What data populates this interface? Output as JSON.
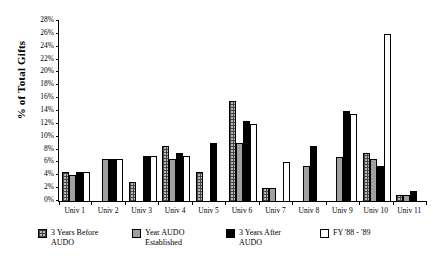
{
  "chart_data": {
    "type": "bar",
    "title": "",
    "xlabel": "",
    "ylabel": "% of Total Gifts",
    "ylim": [
      0,
      28
    ],
    "ytick_step": 2,
    "ytick_labels": [
      "0%",
      "2%",
      "4%",
      "6%",
      "8%",
      "10%",
      "12%",
      "14%",
      "16%",
      "18%",
      "20%",
      "22%",
      "24%",
      "26%",
      "28%"
    ],
    "grid": false,
    "legend_position": "bottom",
    "categories": [
      "Univ 1",
      "Univ 2",
      "Univ 3",
      "Univ 4",
      "Univ 5",
      "Univ 6",
      "Univ 7",
      "Univ 8",
      "Univ 9",
      "Univ 10",
      "Univ 11"
    ],
    "series": [
      {
        "name": "3 Years Before AUDO",
        "color": "#b9b9b9",
        "pattern": "crosshatch",
        "values": [
          4.5,
          0,
          3.0,
          8.5,
          4.5,
          15.5,
          2.0,
          0,
          0,
          7.5,
          1.0
        ]
      },
      {
        "name": "Year AUDO Established",
        "color": "#a0a0a0",
        "pattern": "solid-gray",
        "values": [
          4.0,
          6.5,
          0,
          6.5,
          0,
          9.0,
          2.0,
          5.5,
          6.8,
          6.5,
          1.0
        ]
      },
      {
        "name": "3 Years After AUDO",
        "color": "#000000",
        "pattern": "solid-black",
        "values": [
          4.5,
          6.5,
          7.0,
          7.5,
          9.0,
          12.5,
          0,
          8.5,
          14.0,
          5.5,
          1.5
        ]
      },
      {
        "name": "FY '88 - '89",
        "color": "#ffffff",
        "pattern": "open",
        "values": [
          4.5,
          6.5,
          7.0,
          7.0,
          0,
          12.0,
          6.0,
          0,
          13.5,
          26.0,
          0
        ]
      }
    ]
  },
  "legend": {
    "items": [
      {
        "label": "3 Years Before\nAUDO"
      },
      {
        "label": "Year AUDO\nEstablished"
      },
      {
        "label": "3 Years After\nAUDO"
      },
      {
        "label": "FY  '88 - '89"
      }
    ]
  }
}
